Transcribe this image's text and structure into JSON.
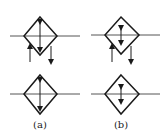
{
  "figure": {
    "panels": [
      {
        "label": "(a)",
        "symbol": "filter-with-drain-manual",
        "description": "Diamond symbol with full-length double-headed vertical arrow"
      },
      {
        "label": "(b)",
        "symbol": "filter-with-drain-short",
        "description": "Diamond symbol with short double-headed vertical arrow"
      }
    ],
    "colors": {
      "stroke": "#1a1a1a",
      "line": "#555555",
      "background": "#ffffff"
    }
  }
}
